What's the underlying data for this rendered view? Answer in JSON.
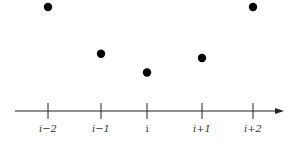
{
  "chart_data": {
    "type": "scatter",
    "title": "",
    "xlabel": "",
    "ylabel": "",
    "categories": [
      "i−2",
      "i−1",
      "i",
      "i+1",
      "i+2"
    ],
    "values": [
      1.0,
      0.55,
      0.37,
      0.51,
      1.0
    ],
    "ylim": [
      0,
      1.0
    ],
    "axis": {
      "direction": "right",
      "arrow": true
    },
    "grid": false,
    "colors": {
      "point": "#000000",
      "axis": "#222222"
    }
  }
}
